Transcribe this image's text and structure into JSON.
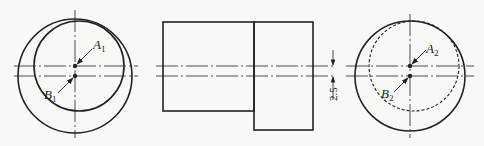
{
  "figure": {
    "views": [
      {
        "name": "left-end-view",
        "outer_circle": {
          "cx": 75,
          "cy": 76,
          "r": 57
        },
        "inner_circle": {
          "cx": 79,
          "cy": 66,
          "r": 45,
          "style": "solid"
        },
        "point_A": {
          "label": "A",
          "sub": "1",
          "x": 75,
          "y": 66
        },
        "point_B": {
          "label": "B",
          "sub": "1",
          "x": 75,
          "y": 76
        }
      },
      {
        "name": "front-view",
        "rect_left": {
          "x": 163,
          "y": 22,
          "w": 91,
          "h": 89
        },
        "rect_right": {
          "x": 254,
          "y": 22,
          "w": 59,
          "h": 108
        },
        "dimension": {
          "value": "2.5"
        }
      },
      {
        "name": "right-end-view",
        "outer_circle": {
          "cx": 410,
          "cy": 76,
          "r": 55
        },
        "inner_circle": {
          "cx": 414,
          "cy": 66,
          "r": 45,
          "style": "dashed"
        },
        "point_A": {
          "label": "A",
          "sub": "2",
          "x": 410,
          "y": 66
        },
        "point_B": {
          "label": "B",
          "sub": "2",
          "x": 410,
          "y": 76
        }
      }
    ],
    "colors": {
      "line": "#222222",
      "background": "#f8f8f6"
    }
  }
}
